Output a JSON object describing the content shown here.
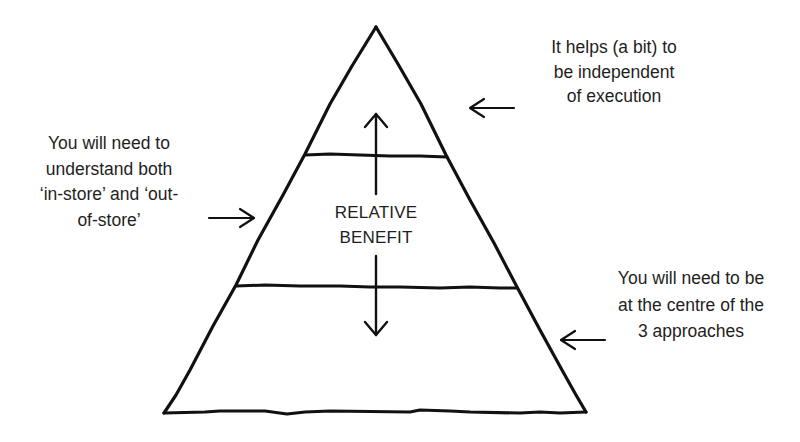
{
  "diagram": {
    "type": "pyramid",
    "tiers": 3,
    "stroke_color": "#111111",
    "background_color": "#ffffff",
    "center_label": {
      "lines": [
        "RELATIVE",
        "BENEFIT"
      ]
    },
    "central_arrow": {
      "direction": "bidirectional-vertical",
      "meaning": "relative benefit"
    },
    "annotations": {
      "top_right": {
        "points_to": "top tier",
        "arrow_direction": "left",
        "lines": [
          "It helps (a bit) to",
          "be independent",
          "of execution"
        ]
      },
      "left": {
        "points_to": "middle tier",
        "arrow_direction": "right",
        "lines": [
          "You will need to",
          "understand both",
          "‘in-store’ and ‘out-",
          "of-store’"
        ]
      },
      "bottom_right": {
        "points_to": "bottom tier",
        "arrow_direction": "left",
        "lines": [
          "You will need to be",
          "at the centre of the",
          "3 approaches"
        ]
      }
    }
  }
}
